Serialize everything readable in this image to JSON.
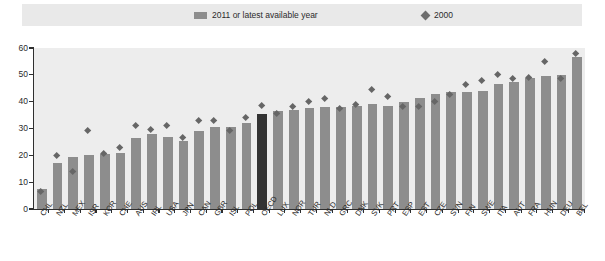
{
  "legend": {
    "bars_label": "2011 or latest available year",
    "points_label": "2000",
    "bar_swatch_icon": "legend-bar-swatch",
    "point_swatch_icon": "legend-diamond-swatch"
  },
  "colors": {
    "bar": "#8d8d8d",
    "bar_highlight": "#333333",
    "point": "#666666",
    "plot_background": "#ededed",
    "legend_background": "#e9e9e9",
    "axis": "#2f2f2f"
  },
  "chart_data": {
    "type": "bar",
    "title": "",
    "subtitle": "",
    "xlabel": "",
    "ylabel": "",
    "ylim": [
      0,
      60
    ],
    "yticks": [
      0,
      10,
      20,
      30,
      40,
      50,
      60
    ],
    "grid": false,
    "legend_position": "top",
    "highlight_category": "OECD",
    "categories": [
      "CHL",
      "NZL",
      "MEX",
      "ISR",
      "KOR",
      "CHE",
      "AUS",
      "IRL",
      "USA",
      "JPN",
      "CAN",
      "GBR",
      "ISL",
      "POL",
      "OECD",
      "LUX",
      "NOR",
      "TUR",
      "NLD",
      "GRC",
      "DNK",
      "SVK",
      "PRT",
      "ESP",
      "EST",
      "CZE",
      "SVN",
      "FIN",
      "SWE",
      "ITA",
      "AUT",
      "FRA",
      "HUN",
      "DEU",
      "BEL"
    ],
    "series": [
      {
        "name": "2011 or latest available year",
        "type": "bar",
        "values": [
          7.5,
          17.0,
          19.5,
          20.0,
          20.5,
          21.0,
          26.5,
          28.0,
          27.0,
          25.5,
          29.0,
          30.5,
          30.5,
          32.0,
          35.5,
          36.5,
          37.0,
          37.5,
          38.0,
          38.0,
          38.5,
          39.0,
          38.5,
          40.0,
          41.5,
          43.0,
          43.5,
          43.5,
          44.0,
          46.5,
          47.5,
          49.0,
          49.5,
          50.0,
          56.5
        ]
      },
      {
        "name": "2000",
        "type": "scatter",
        "marker": "diamond",
        "values": [
          6.5,
          20.0,
          14.0,
          29.0,
          20.5,
          23.0,
          31.0,
          29.5,
          31.0,
          26.5,
          33.0,
          33.0,
          29.0,
          34.0,
          38.5,
          35.5,
          38.0,
          40.0,
          41.0,
          37.5,
          39.0,
          44.5,
          42.0,
          38.0,
          38.0,
          40.0,
          42.5,
          46.5,
          48.0,
          50.0,
          48.5,
          49.0,
          55.0,
          48.5,
          58.0
        ]
      }
    ]
  }
}
